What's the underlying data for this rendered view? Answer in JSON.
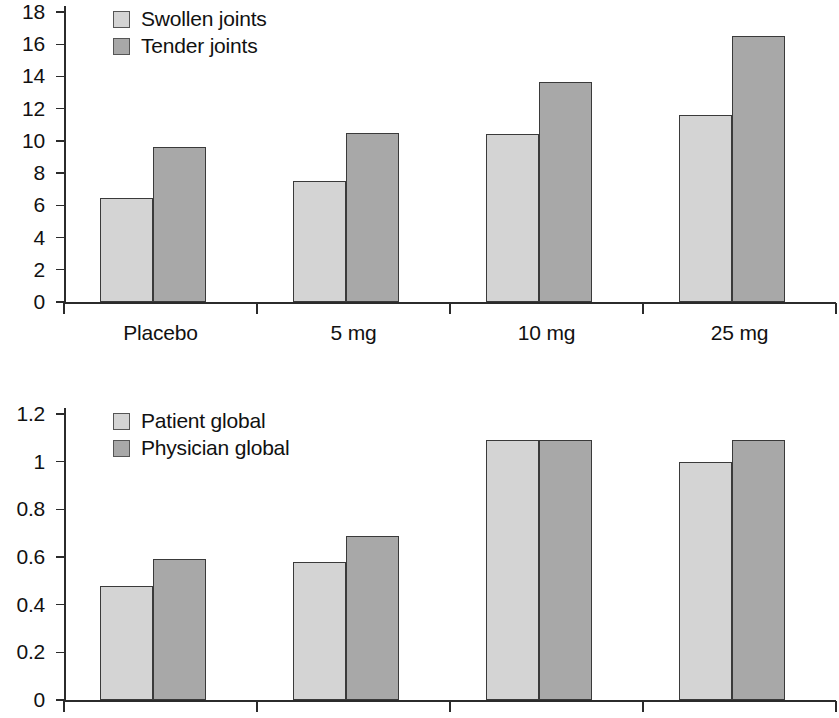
{
  "chart_data": [
    {
      "id": "joint-counts",
      "type": "bar",
      "title": "",
      "xlabel": "",
      "ylabel": "",
      "categories": [
        "Placebo",
        "5 mg",
        "10 mg",
        "25 mg"
      ],
      "series": [
        {
          "name": "Swollen joints",
          "values": [
            6.45,
            7.5,
            10.45,
            11.6
          ],
          "color": "#d4d4d4"
        },
        {
          "name": "Tender joints",
          "values": [
            9.6,
            10.5,
            13.65,
            16.5
          ],
          "color": "#a8a8a8"
        }
      ],
      "ylim": [
        0,
        18
      ],
      "ytick_values": [
        0,
        2,
        4,
        6,
        8,
        10,
        12,
        14,
        16,
        18
      ],
      "ytick_labels": [
        "0",
        "2",
        "4",
        "6",
        "8",
        "10",
        "12",
        "14",
        "16",
        "18"
      ],
      "grid": false,
      "legend_position": "upper left",
      "xaxis_labels_visible": true
    },
    {
      "id": "global-assessments",
      "type": "bar",
      "title": "",
      "xlabel": "",
      "ylabel": "",
      "categories": [
        "Placebo",
        "5 mg",
        "10 mg",
        "25 mg"
      ],
      "series": [
        {
          "name": "Patient global",
          "values": [
            0.48,
            0.58,
            1.09,
            1.0
          ],
          "color": "#d4d4d4"
        },
        {
          "name": "Physician global",
          "values": [
            0.59,
            0.69,
            1.09,
            1.09
          ],
          "color": "#a8a8a8"
        }
      ],
      "ylim": [
        0,
        1.2
      ],
      "ytick_values": [
        0,
        0.2,
        0.4,
        0.6,
        0.8,
        1,
        1.2
      ],
      "ytick_labels": [
        "0",
        "0.2",
        "0.4",
        "0.6",
        "0.8",
        "1",
        "1.2"
      ],
      "grid": false,
      "legend_position": "upper left",
      "xaxis_labels_visible": false
    }
  ]
}
